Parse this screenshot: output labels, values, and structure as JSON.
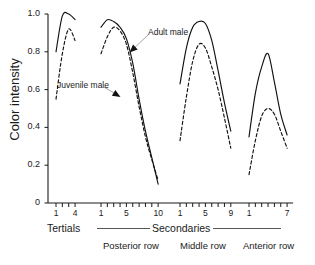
{
  "chart_data": {
    "type": "line",
    "title": "",
    "xlabel": "",
    "ylabel": "Color intensity",
    "ylim": [
      0,
      1.0
    ],
    "grid": false,
    "legend_position": "inline-annotations",
    "y_ticks": [
      "0",
      "0.2",
      "0.4",
      "0.6",
      "0.8",
      "1.0"
    ],
    "y_tick_values": [
      0,
      0.2,
      0.4,
      0.6,
      0.8,
      1.0
    ],
    "series_names": [
      "Adult male",
      "Juvenile male"
    ],
    "annotations": [
      {
        "text": "Adult male",
        "target_series": "Adult male"
      },
      {
        "text": "Juvenile male",
        "target_series": "Juvenile male"
      }
    ],
    "group_brackets": [
      {
        "label": "Tertials",
        "groups": [
          "Tertials"
        ]
      },
      {
        "label": "Secondaries",
        "groups": [
          "Posterior row",
          "Middle row",
          "Anterior row"
        ]
      }
    ],
    "groups": [
      {
        "name": "Tertials",
        "n_ticks": 4,
        "x": [
          1,
          2,
          3,
          4
        ],
        "tick_labels": [
          {
            "index": 1,
            "text": "1"
          },
          {
            "index": 4,
            "text": "4"
          }
        ],
        "series": [
          {
            "name": "Adult male",
            "style": "solid",
            "values": [
              0.8,
              0.99,
              1.0,
              0.97
            ]
          },
          {
            "name": "Juvenile male",
            "style": "dashed",
            "values": [
              0.55,
              0.79,
              0.92,
              0.86
            ]
          }
        ]
      },
      {
        "name": "Posterior row",
        "n_ticks": 10,
        "x": [
          1,
          2,
          3,
          4,
          5,
          6,
          7,
          8,
          9,
          10
        ],
        "tick_labels": [
          {
            "index": 1,
            "text": "1"
          },
          {
            "index": 5,
            "text": "5"
          },
          {
            "index": 10,
            "text": "10"
          }
        ],
        "series": [
          {
            "name": "Adult male",
            "style": "solid",
            "values": [
              0.93,
              0.97,
              0.96,
              0.93,
              0.87,
              0.74,
              0.55,
              0.38,
              0.24,
              0.1
            ]
          },
          {
            "name": "Juvenile male",
            "style": "dashed",
            "values": [
              0.79,
              0.88,
              0.93,
              0.91,
              0.84,
              0.69,
              0.51,
              0.35,
              0.23,
              0.12
            ]
          }
        ]
      },
      {
        "name": "Middle row",
        "n_ticks": 9,
        "x": [
          1,
          2,
          3,
          4,
          5,
          6,
          7,
          8,
          9
        ],
        "tick_labels": [
          {
            "index": 1,
            "text": "1"
          },
          {
            "index": 5,
            "text": "5"
          },
          {
            "index": 9,
            "text": "9"
          }
        ],
        "series": [
          {
            "name": "Adult male",
            "style": "solid",
            "values": [
              0.63,
              0.82,
              0.93,
              0.96,
              0.95,
              0.86,
              0.7,
              0.53,
              0.38
            ]
          },
          {
            "name": "Juvenile male",
            "style": "dashed",
            "values": [
              0.33,
              0.56,
              0.75,
              0.84,
              0.82,
              0.72,
              0.6,
              0.45,
              0.29
            ]
          }
        ]
      },
      {
        "name": "Anterior row",
        "n_ticks": 7,
        "x": [
          1,
          2,
          3,
          4,
          5,
          6,
          7
        ],
        "tick_labels": [
          {
            "index": 1,
            "text": "1"
          },
          {
            "index": 7,
            "text": "7"
          }
        ],
        "series": [
          {
            "name": "Adult male",
            "style": "solid",
            "values": [
              0.35,
              0.58,
              0.72,
              0.79,
              0.64,
              0.47,
              0.36
            ]
          },
          {
            "name": "Juvenile male",
            "style": "dashed",
            "values": [
              0.15,
              0.33,
              0.46,
              0.5,
              0.47,
              0.38,
              0.29
            ]
          }
        ]
      }
    ]
  }
}
